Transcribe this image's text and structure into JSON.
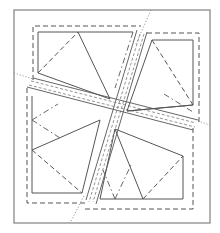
{
  "diagram": {
    "title": "",
    "colors": {
      "outer_border": "#8a8a8a",
      "lines": "#555555",
      "background": "#ffffff"
    },
    "outer_border": {
      "x1": 14,
      "y1": 10,
      "x2": 210,
      "y2": 223
    },
    "seam_allowance": {
      "x1": 33,
      "y1": 26,
      "x2": 199,
      "y2": 209
    },
    "strips": [
      {
        "name": "steep-strip",
        "from": [
          150,
          10
        ],
        "to": [
          70,
          223
        ]
      },
      {
        "name": "shallow-strip",
        "from": [
          14,
          73
        ],
        "to": [
          210,
          125
        ]
      }
    ],
    "quadrants": [
      "top-left",
      "top-right",
      "bottom-left",
      "bottom-right"
    ],
    "line_styles": [
      "solid",
      "dashed",
      "dash-dot",
      "dotted"
    ]
  }
}
